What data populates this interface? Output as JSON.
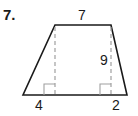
{
  "problem": {
    "number": "7.",
    "shape": "trapezoid",
    "labels": {
      "top_base": "7",
      "height": "9",
      "bottom_left_segment": "4",
      "bottom_right_segment": "2"
    },
    "colors": {
      "outline": "#1a1a1a",
      "dashed": "#a0a0a0"
    }
  }
}
